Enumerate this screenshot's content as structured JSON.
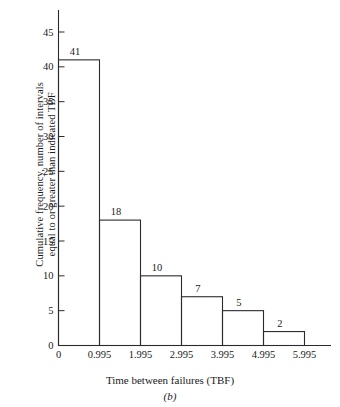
{
  "figure": {
    "caption": "(b)",
    "xlabel": "Time between failures (TBF)",
    "ylabel_line1": "Cumulative frequency, number of intervals",
    "ylabel_line2": "equal to or greater than indicated TBF",
    "line_color": "#2b2b2b",
    "background": "#ffffff"
  },
  "chart_data": {
    "type": "bar",
    "title": "",
    "subtitle": "",
    "xlabel": "Time between failures (TBF)",
    "ylabel": "Cumulative frequency, number of intervals equal to or greater than indicated TBF",
    "categories": [
      "0–0.995",
      "0.995–1.995",
      "1.995–2.995",
      "2.995–3.995",
      "3.995–4.995",
      "4.995–5.995"
    ],
    "bin_edges": [
      0,
      0.995,
      1.995,
      2.995,
      3.995,
      4.995,
      5.995
    ],
    "values": [
      41,
      18,
      10,
      7,
      5,
      2
    ],
    "data_labels": [
      "41",
      "18",
      "10",
      "7",
      "5",
      "2"
    ],
    "xlim": [
      0,
      5.995
    ],
    "ylim": [
      0,
      45
    ],
    "xticks": [
      0,
      0.995,
      1.995,
      2.995,
      3.995,
      4.995,
      5.995
    ],
    "xtick_labels": [
      "0",
      "0.995",
      "1.995",
      "2.995",
      "3.995",
      "4.995",
      "5.995"
    ],
    "yticks": [
      0,
      5,
      10,
      15,
      20,
      25,
      30,
      35,
      40,
      45
    ],
    "ytick_labels": [
      "0",
      "5",
      "10",
      "15",
      "20",
      "25",
      "30",
      "35",
      "40",
      "45"
    ],
    "grid": false,
    "legend": null,
    "series": [
      {
        "name": "Cumulative frequency",
        "values": [
          41,
          18,
          10,
          7,
          5,
          2
        ]
      }
    ]
  }
}
